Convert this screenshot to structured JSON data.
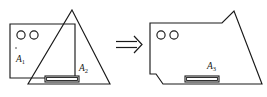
{
  "figure": {
    "background_color": "#ffffff",
    "stroke_color": "#1a1a1a",
    "operator": {
      "symbol": "⟹",
      "name": "implies-arrow",
      "x": 122,
      "y": 45
    },
    "left_panel": {
      "name": "operands",
      "shapes": [
        {
          "id": "A1",
          "name": "rectangle",
          "label": "A",
          "subscript": "1",
          "label_x": 16,
          "label_y": 62,
          "x": 10,
          "y": 24,
          "width": 65,
          "height": 54,
          "features": [
            {
              "name": "hole",
              "cx": 21,
              "cy": 35,
              "r": 4.1
            },
            {
              "name": "hole",
              "cx": 34,
              "cy": 35,
              "r": 4.1
            },
            {
              "name": "speck",
              "cx": 16,
              "cy": 48,
              "r": 0.8
            }
          ]
        },
        {
          "id": "A2",
          "name": "triangle",
          "label": "A",
          "subscript": "2",
          "label_x": 79,
          "label_y": 71,
          "apex_x": 72,
          "apex_y": 10,
          "base_left_x": 28,
          "base_right_x": 110,
          "base_y": 84,
          "features": [
            {
              "name": "slot",
              "x": 45,
              "y": 76,
              "width": 34,
              "height": 6
            }
          ]
        }
      ]
    },
    "right_panel": {
      "name": "result",
      "shape": {
        "id": "A3",
        "name": "union-outline",
        "label": "A",
        "subscript": "3",
        "label_x": 207,
        "label_y": 69,
        "outline": "M 150 23 L 222 23 L 234 11 L 262 84 L 163 84 L 156 74 L 150 74 Z",
        "features": [
          {
            "name": "hole",
            "cx": 161,
            "cy": 35,
            "r": 4.1
          },
          {
            "name": "hole",
            "cx": 174,
            "cy": 35,
            "r": 4.1
          },
          {
            "name": "slot",
            "x": 185,
            "y": 76,
            "width": 34,
            "height": 6
          }
        ]
      }
    }
  }
}
